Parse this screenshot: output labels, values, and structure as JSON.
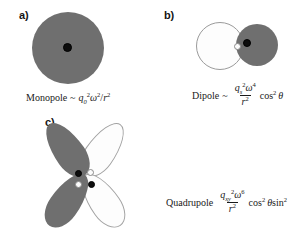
{
  "figure": {
    "type": "multipole-radiation-diagram",
    "panels": [
      {
        "id": "a",
        "label": "a)",
        "shape": "filled-circle",
        "caption_name": "Monopole",
        "relation": "~",
        "charge_symbol": "q",
        "charge_subscript": "0",
        "charge_exponent": "2",
        "omega_exponent": "2",
        "radius_symbol": "r",
        "radius_exponent": "2",
        "angular_factor": "",
        "formula_plain": "Monopole ~ q_0^2 ω^2 / r^2",
        "dots": [
          {
            "name": "black-charge",
            "fill": "#0d0d0d"
          }
        ]
      },
      {
        "id": "b",
        "label": "b)",
        "shape": "two-lobe-dipole",
        "caption_name": "Dipole",
        "relation": "~",
        "charge_symbol": "q",
        "charge_subscript": "s",
        "charge_exponent": "2",
        "omega_exponent": "4",
        "radius_symbol": "r",
        "radius_exponent": "2",
        "angular_factor": "cos",
        "angular_exponent": "2",
        "angle_symbol": "θ",
        "formula_plain": "Dipole ~ (q_s^2 ω^4 / r^2) cos^2 θ",
        "dots": [
          {
            "name": "white-charge",
            "fill": "#fbfbfb"
          },
          {
            "name": "black-charge",
            "fill": "#0d0d0d"
          }
        ]
      },
      {
        "id": "c",
        "label": "c)",
        "shape": "four-lobe-quadrupole",
        "caption_name": "Quadrupole",
        "relation": "",
        "charge_symbol": "q",
        "charge_subscript": "xy",
        "charge_exponent": "2",
        "omega_exponent": "6",
        "radius_symbol": "r",
        "radius_exponent": "2",
        "angular_factor": "cos",
        "angular_exponent": "2",
        "angular_factor_2": "sin",
        "angular_exponent_2": "2",
        "angle_symbol": "θ",
        "formula_plain": "Quadrupole (q_xy^2 ω^6 / r^2) cos^2 θ sin^2 θ",
        "dots": [
          {
            "name": "black-charge",
            "fill": "#0d0d0d"
          },
          {
            "name": "white-charge",
            "fill": "#fbfbfb"
          },
          {
            "name": "white-charge",
            "fill": "#fbfbfb"
          },
          {
            "name": "black-charge",
            "fill": "#0d0d0d"
          }
        ]
      }
    ],
    "symbols": {
      "omega": "ω",
      "theta": "θ",
      "tilde": "~",
      "slash": "/"
    },
    "colors": {
      "lobe_dark": "#6f6f6f",
      "lobe_light": "#fdfdfd",
      "lobe_light_stroke": "#a2a2a2",
      "dot_black": "#0d0d0d",
      "dot_white": "#fbfbfb",
      "text": "#1a1a1a",
      "background": "#ffffff"
    }
  }
}
